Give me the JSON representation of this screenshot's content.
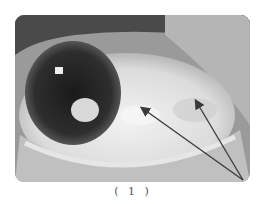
{
  "figure": {
    "caption": "( 1 )",
    "annotations": [
      {
        "type": "arrow",
        "from": [
          243,
          180
        ],
        "to": [
          142,
          108
        ]
      },
      {
        "type": "arrow",
        "from": [
          243,
          180
        ],
        "to": [
          195,
          100
        ]
      }
    ],
    "colors": {
      "arrow": "#3a3a3a",
      "caption": "#555555"
    }
  }
}
